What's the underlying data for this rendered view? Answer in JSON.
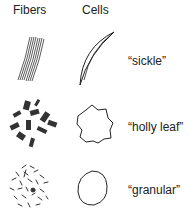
{
  "headers": {
    "fibers": "Fibers",
    "cells": "Cells"
  },
  "rows": [
    {
      "fiber_pattern": "parallel-bundle",
      "cell_shape": "sickle-icon",
      "label": "“sickle”"
    },
    {
      "fiber_pattern": "scattered-bundles",
      "cell_shape": "holly-leaf-icon",
      "label": "“holly leaf”"
    },
    {
      "fiber_pattern": "short-random-fibers",
      "cell_shape": "granular-circle-icon",
      "label": "“granular”"
    }
  ]
}
